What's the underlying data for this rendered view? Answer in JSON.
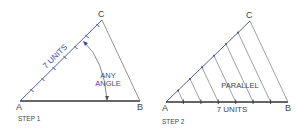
{
  "step1": {
    "caption": "STEP 1",
    "points": {
      "A": "A",
      "B": "B",
      "C": "C"
    },
    "line_label": "7 UNITS",
    "angle_label_1": "ANY",
    "angle_label_2": "ANGLE"
  },
  "step2": {
    "caption": "STEP 2",
    "points": {
      "A": "A",
      "B": "B",
      "C": "C"
    },
    "base_label": "7 UNITS",
    "parallel_label": "PARALLEL"
  },
  "colors": {
    "construction_line": "#3b4e9a",
    "base_line": "#333333",
    "side_line": "#777777"
  }
}
